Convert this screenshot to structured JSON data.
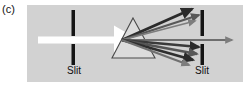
{
  "figure": {
    "panel_label": "(c)",
    "caption_labels": {
      "slit_left": "Slit",
      "slit_right": "Slit"
    },
    "colors": {
      "background": "#ffffff",
      "panel_background": "#d2d2d2",
      "slit_bar": "#141414",
      "incident_beam": "#ffffff",
      "prism_fill": "#dcdcdc",
      "prism_outline": "#4a4a4a",
      "ray_dark": "#2b2b2b",
      "ray_mid": "#565656",
      "ray_light": "#808080",
      "label_text": "#101010"
    }
  },
  "diagram_data": {
    "type": "optics-ray-diagram",
    "description": "White light passes through a first slit, is dispersed by a triangular prism into a fan of rays, and a single ray passes through the gap in a second slit.",
    "elements": {
      "incident_beam": {
        "name": "white-light-beam",
        "direction": "left-to-right",
        "start_x": 11,
        "start_y": 35,
        "end_x": 98,
        "end_y": 35,
        "thickness": 7,
        "color": "#ffffff",
        "arrowhead": true
      },
      "slit_left": {
        "name": "first-slit",
        "x": 46,
        "top_segment": {
          "y1": 5,
          "y2": 31
        },
        "bottom_segment": {
          "y1": 39,
          "y2": 60
        },
        "width": 3.5,
        "color": "#141414"
      },
      "prism": {
        "name": "dispersing-prism",
        "apex": {
          "x": 106,
          "y": 13
        },
        "base_left": {
          "x": 85,
          "y": 53
        },
        "base_right": {
          "x": 128,
          "y": 53
        },
        "fill": "#dcdcdc",
        "outline": "#4a4a4a"
      },
      "dispersion_origin": {
        "x": 95,
        "y": 35
      },
      "slit_right": {
        "name": "second-slit",
        "x": 175,
        "top_segment": {
          "y1": 5,
          "y2": 31
        },
        "bottom_segment": {
          "y1": 39,
          "y2": 60
        },
        "width": 3.5,
        "color": "#141414"
      },
      "refracted_rays": [
        {
          "id": "ray-up-1",
          "end_x": 165,
          "end_y": 4,
          "width": 3.0,
          "color": "#2b2b2b"
        },
        {
          "id": "ray-up-2",
          "end_x": 172,
          "end_y": 10,
          "width": 2.2,
          "color": "#585858"
        },
        {
          "id": "ray-up-3",
          "end_x": 168,
          "end_y": 16,
          "width": 1.8,
          "color": "#7d7d7d"
        },
        {
          "id": "ray-center",
          "end_x": 205,
          "end_y": 35,
          "width": 1.8,
          "color": "#6e6e6e"
        },
        {
          "id": "ray-down-1",
          "end_x": 172,
          "end_y": 42,
          "width": 2.6,
          "color": "#3a3a3a"
        },
        {
          "id": "ray-down-2",
          "end_x": 170,
          "end_y": 49,
          "width": 2.4,
          "color": "#555555"
        },
        {
          "id": "ray-down-3",
          "end_x": 166,
          "end_y": 55,
          "width": 2.8,
          "color": "#2f2f2f"
        },
        {
          "id": "ray-down-4",
          "end_x": 162,
          "end_y": 60,
          "width": 2.0,
          "color": "#707070"
        }
      ],
      "transmitted_ray": {
        "name": "transmitted-ray-through-second-slit",
        "start_x": 175,
        "end_x": 205,
        "y": 35,
        "color": "#6e6e6e"
      }
    }
  }
}
